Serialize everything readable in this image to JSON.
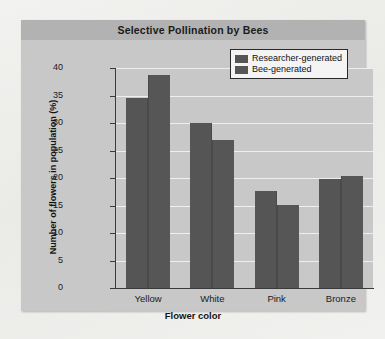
{
  "chart_data": {
    "type": "bar",
    "title": "Selective Pollination by Bees",
    "xlabel": "Flower color",
    "ylabel": "Number of flowers in population (%)",
    "categories": [
      "Yellow",
      "White",
      "Pink",
      "Bronze"
    ],
    "series": [
      {
        "name": "Researcher-generated",
        "color": "#555555",
        "values": [
          34.5,
          30.0,
          17.6,
          19.8
        ]
      },
      {
        "name": "Bee-generated",
        "color": "#565656",
        "values": [
          38.7,
          27.0,
          15.1,
          20.3
        ]
      }
    ],
    "ylim": [
      0,
      40
    ],
    "yticks": [
      0,
      5,
      10,
      15,
      20,
      25,
      30,
      35,
      40
    ],
    "ytick_labels": [
      "0",
      "5",
      "10",
      "15",
      "20",
      "25",
      "30",
      "35",
      "40"
    ],
    "grid": "horizontal",
    "legend_position": "top-right",
    "plot_background": "#c8c8c8",
    "gridline_color": "#eeeeee",
    "panel_background": "#c8c8c8",
    "title_band_color": "#b2b2b2"
  }
}
